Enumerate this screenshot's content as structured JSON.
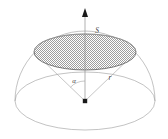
{
  "figure": {
    "background_color": "#ffffff",
    "labels": [
      {
        "id": "cap-area",
        "text": "S",
        "x": 97,
        "y": 33,
        "style": "italic",
        "meaning": "area-of-spherical-cap"
      },
      {
        "id": "half-angle",
        "text": "α",
        "x": 74,
        "y": 83,
        "style": "italic",
        "meaning": "cone-half-angle"
      },
      {
        "id": "radius",
        "text": "r",
        "x": 110,
        "y": 80,
        "style": "italic",
        "meaning": "sphere-radius"
      }
    ],
    "colors": {
      "outline": "#9a9a9a",
      "cap_edge": "#5c5c5c",
      "cone_line": "#a0a0a0",
      "axis": "#8f8f8f",
      "marker": "#1a1a1a",
      "hatch": "#8c8c8c",
      "label": "#4a4a4a"
    },
    "geometry": {
      "center": {
        "x": 85,
        "y": 101
      },
      "dome_radius_x": 70,
      "dome_radius_y": 29,
      "dome_top_y": 31,
      "cap_center": {
        "x": 85,
        "y": 52
      },
      "cap_radius_x": 51,
      "cap_radius_y": 18,
      "axis_top_y": 9,
      "arrow_tip_y": 9,
      "angle_arc_radius": 20
    },
    "elements": {
      "axis": "vertical-axis-with-arrow",
      "marker": "center-point-square",
      "cap_fill": "dotted-hatch-gray",
      "equator": "ellipse",
      "dome": "upper-half-ellipse"
    }
  }
}
